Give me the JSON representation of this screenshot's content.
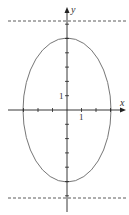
{
  "chart_data": {
    "type": "line",
    "title": "",
    "xlabel": "x",
    "ylabel": "y",
    "tick_labels": {
      "x": [
        "1"
      ],
      "y": [
        "1"
      ]
    },
    "curve": {
      "shape": "ellipse",
      "equation": "x^2/9 + y^2/25 = 1",
      "semi_axis_x": 3,
      "semi_axis_y": 5,
      "center": [
        0,
        0
      ]
    },
    "dashed_lines": [
      {
        "y": 6.25
      },
      {
        "y": -6.25
      }
    ],
    "xlim": [
      -4.2,
      4.2
    ],
    "ylim": [
      -7,
      7.5
    ],
    "grid": false,
    "x_ticks": [
      -3,
      -2,
      -1,
      1,
      2,
      3
    ],
    "y_ticks": [
      -6,
      -5,
      -4,
      -3,
      -2,
      -1,
      1,
      2,
      3,
      4,
      5,
      6
    ],
    "colors": {
      "axis": "#222222",
      "curve": "#666666",
      "dash": "#333333"
    }
  }
}
